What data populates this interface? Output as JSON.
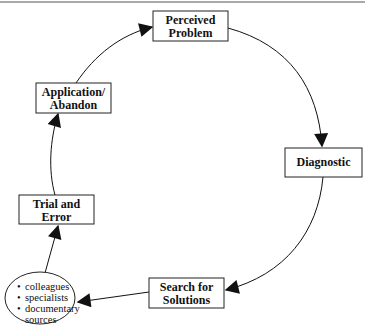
{
  "diagram": {
    "type": "cycle",
    "colors": {
      "stroke": "#1a1a1a",
      "fill": "#ffffff",
      "text": "#111111"
    },
    "nodes": [
      {
        "id": "perceived-problem",
        "lines": [
          "Perceived",
          "Problem"
        ]
      },
      {
        "id": "diagnostic",
        "lines": [
          "Diagnostic"
        ]
      },
      {
        "id": "search-for-solutions",
        "lines": [
          "Search for",
          "Solutions"
        ]
      },
      {
        "id": "sources",
        "shape": "ellipse",
        "items": [
          "colleagues",
          "specialists",
          "documentary",
          "sources"
        ]
      },
      {
        "id": "trial-and-error",
        "lines": [
          "Trial and",
          "Error"
        ]
      },
      {
        "id": "application-abandon",
        "lines": [
          "Application/",
          "Abandon"
        ]
      }
    ],
    "edges": [
      {
        "from": "perceived-problem",
        "to": "diagnostic"
      },
      {
        "from": "diagnostic",
        "to": "search-for-solutions"
      },
      {
        "from": "search-for-solutions",
        "to": "sources"
      },
      {
        "from": "sources",
        "to": "trial-and-error"
      },
      {
        "from": "trial-and-error",
        "to": "application-abandon"
      },
      {
        "from": "application-abandon",
        "to": "perceived-problem"
      }
    ]
  },
  "bullet": "•"
}
